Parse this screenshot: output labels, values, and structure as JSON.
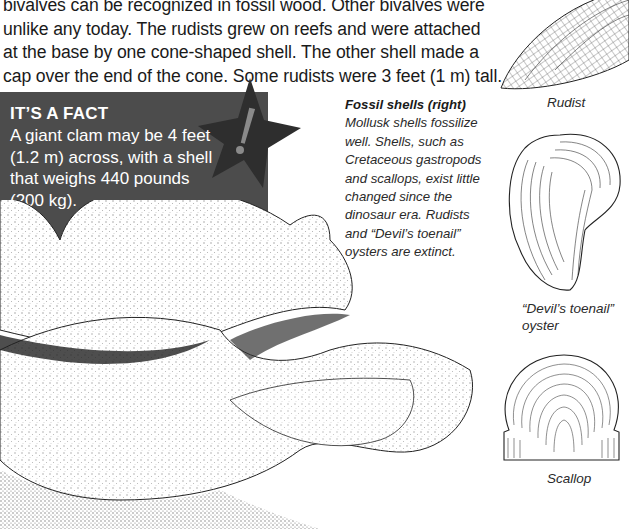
{
  "body_text": {
    "lines": [
      "bivalves can be recognized in fossil wood. Other bivalves were",
      "unlike any today. The rudists grew on reefs and were attached",
      "at the base by one cone-shaped shell. The other shell made a",
      "cap over the end of the cone. Some rudists were 3 feet (1 m) tall."
    ]
  },
  "fact_box": {
    "title": "IT’S A FACT",
    "lines": [
      "A giant clam may be 4 feet",
      "(1.2 m) across, with a shell",
      "that weighs 440 pounds",
      "(200 kg)."
    ],
    "icon": "exclamation-star-icon",
    "background_color": "#4c4c4c",
    "star_color": "#2e2e2e",
    "exclamation_color": "#8a8a8a"
  },
  "caption": {
    "title": "Fossil shells (right)",
    "lines": [
      "Mollusk shells fossilize",
      "well. Shells, such as",
      "Cretaceous gastropods",
      "and scallops, exist little",
      "changed since the",
      "dinosaur era. Rudists",
      "and “Devil’s toenail”",
      "oysters are extinct."
    ]
  },
  "specimens": [
    {
      "label": "Rudist"
    },
    {
      "label_line1": "“Devil’s toenail”",
      "label_line2": "oyster"
    },
    {
      "label": "Scallop"
    }
  ],
  "illustration": {
    "subject": "giant-clam-illustration"
  }
}
